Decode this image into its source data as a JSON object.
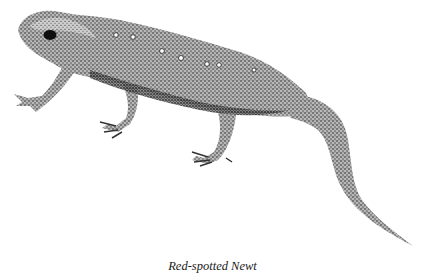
{
  "figure": {
    "style": "stipple pen-and-ink",
    "caption": "Red-spotted Newt",
    "colors": {
      "background": "#ffffff",
      "ink": "#1a1a1a",
      "body_tone": "#8a8a8a"
    }
  }
}
